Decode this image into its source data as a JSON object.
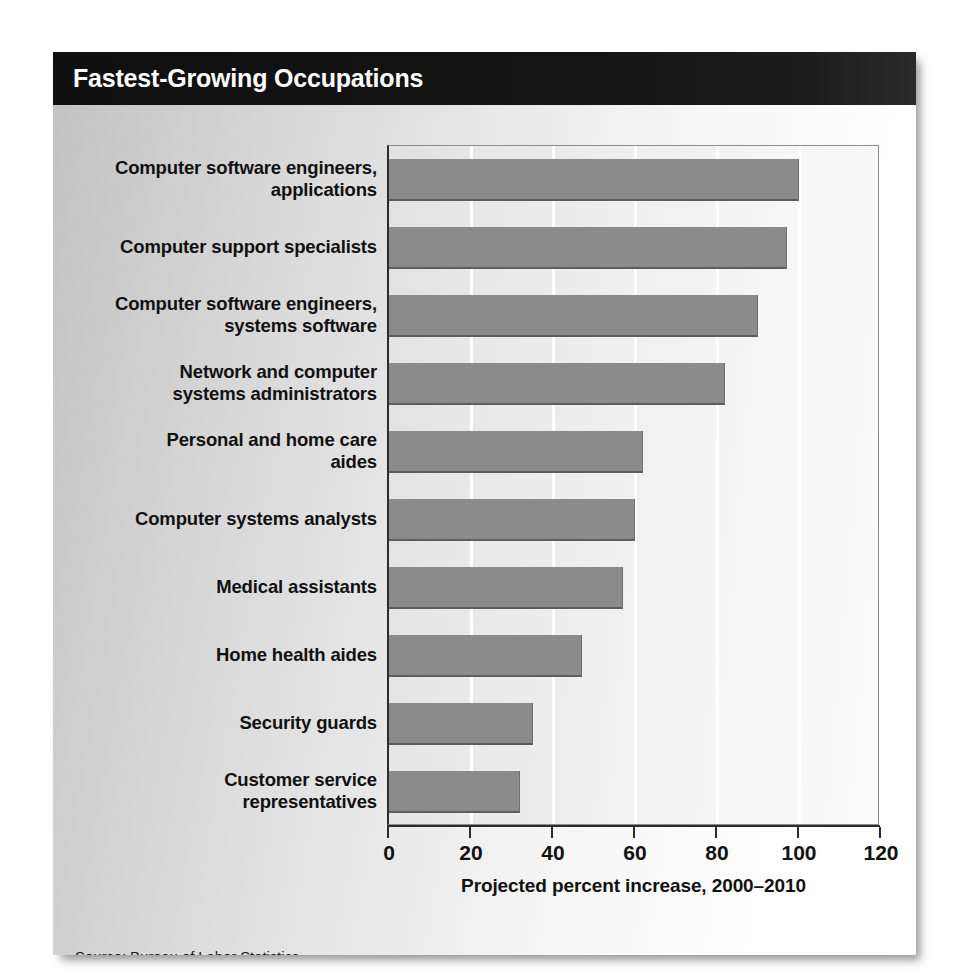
{
  "title": "Fastest-Growing Occupations",
  "source": "Source: Bureau of Labor Statistics",
  "colors": {
    "bar": "#8b8b8b",
    "bar_shadow": "#5d5d5d",
    "header_bg": "#101010",
    "header_text": "#ffffff",
    "axis": "#2c2c2c",
    "gridline": "#ffffff",
    "text": "#111111"
  },
  "chart_data": {
    "type": "bar",
    "orientation": "horizontal",
    "title": "Fastest-Growing Occupations",
    "xlabel": "Projected percent increase, 2000–2010",
    "ylabel": "",
    "xlim": [
      0,
      120
    ],
    "xticks": [
      0,
      20,
      40,
      60,
      80,
      100,
      120
    ],
    "xtick_labels": [
      "0",
      "20",
      "40",
      "60",
      "80",
      "100",
      "120"
    ],
    "grid": "vertical",
    "legend": "none",
    "categories": [
      "Computer software engineers, applications",
      "Computer support specialists",
      "Computer software engineers, systems software",
      "Network and computer systems administrators",
      "Personal and home care aides",
      "Computer systems analysts",
      "Medical assistants",
      "Home health aides",
      "Security guards",
      "Customer service representatives"
    ],
    "category_lines": [
      [
        "Computer software engineers,",
        "applications"
      ],
      [
        "Computer support specialists"
      ],
      [
        "Computer software engineers,",
        "systems software"
      ],
      [
        "Network and computer",
        "systems administrators"
      ],
      [
        "Personal and home care",
        "aides"
      ],
      [
        "Computer systems analysts"
      ],
      [
        "Medical assistants"
      ],
      [
        "Home health aides"
      ],
      [
        "Security guards"
      ],
      [
        "Customer service",
        "representatives"
      ]
    ],
    "values": [
      100,
      97,
      90,
      82,
      62,
      60,
      57,
      47,
      35,
      32
    ]
  }
}
